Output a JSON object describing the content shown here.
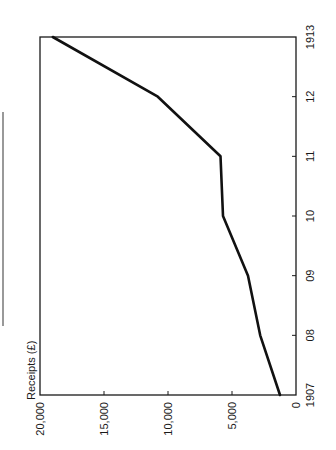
{
  "chart_data": {
    "type": "line",
    "orientation": "rotated-90-ccw",
    "title": "",
    "xlabel": "",
    "ylabel": "Receipts (£)",
    "x": [
      "1907",
      "08",
      "09",
      "10",
      "11",
      "12",
      "1913"
    ],
    "x_numeric": [
      1907,
      1908,
      1909,
      1910,
      1911,
      1912,
      1913
    ],
    "series": [
      {
        "name": "Receipts",
        "values": [
          1250,
          2800,
          3750,
          5700,
          5900,
          10800,
          19000
        ]
      }
    ],
    "ylim": [
      0,
      20000
    ],
    "xlim": [
      1907,
      1913
    ],
    "y_ticks": [
      0,
      5000,
      10000,
      15000,
      20000
    ],
    "y_tick_labels": [
      "0",
      "5,000",
      "10,000",
      "15,000",
      "20,000"
    ],
    "x_tick_labels": [
      "1907",
      "08",
      "09",
      "10",
      "11",
      "12",
      "1913"
    ],
    "grid": false,
    "legend": "none"
  },
  "labels": {
    "axis_title": "Receipts (£)",
    "y_ticks": [
      "0",
      "5,000",
      "10,000",
      "15,000",
      "20,000"
    ],
    "x_ticks": [
      "1907",
      "08",
      "09",
      "10",
      "11",
      "12",
      "1913"
    ]
  },
  "colors": {
    "line": "#111111",
    "frame": "#1a1a1a",
    "background": "#ffffff"
  }
}
